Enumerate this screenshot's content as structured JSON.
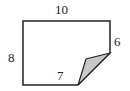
{
  "diagram": {
    "type": "folded-rectangle",
    "labels": {
      "top": "10",
      "left": "8",
      "right": "6",
      "bottom": "7"
    },
    "colors": {
      "stroke": "#222222",
      "fold_fill": "#c8c8c8",
      "background": "#ffffff"
    }
  }
}
